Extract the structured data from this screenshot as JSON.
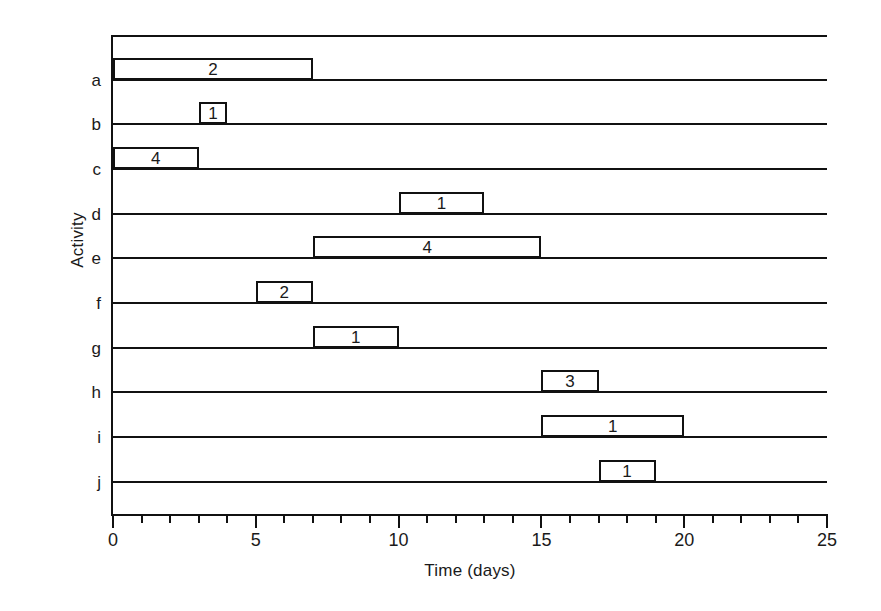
{
  "chart_data": {
    "type": "bar",
    "chart_subtype": "gantt",
    "title": "",
    "xlabel": "Time (days)",
    "ylabel": "Activity",
    "xlim": [
      0,
      25
    ],
    "xticks": [
      0,
      1,
      2,
      3,
      4,
      5,
      6,
      7,
      8,
      9,
      10,
      11,
      12,
      13,
      14,
      15,
      16,
      17,
      18,
      19,
      20,
      21,
      22,
      23,
      24,
      25
    ],
    "xtick_labels": [
      "0",
      "5",
      "10",
      "15",
      "20",
      "25"
    ],
    "xtick_label_values": [
      0,
      5,
      10,
      15,
      20,
      25
    ],
    "xtick_minor_step": 1,
    "categories": [
      "a",
      "b",
      "c",
      "d",
      "e",
      "f",
      "g",
      "h",
      "i",
      "j"
    ],
    "grid": true,
    "grid_axis": "y",
    "legend": false,
    "bar_fill": "none",
    "bar_edge_color": "#111111",
    "background": "#ffffff",
    "tasks": [
      {
        "activity": "a",
        "start": 0,
        "end": 7,
        "duration": 7,
        "label": "2"
      },
      {
        "activity": "b",
        "start": 3,
        "end": 4,
        "duration": 1,
        "label": "1"
      },
      {
        "activity": "c",
        "start": 0,
        "end": 3,
        "duration": 3,
        "label": "4"
      },
      {
        "activity": "d",
        "start": 10,
        "end": 13,
        "duration": 3,
        "label": "1"
      },
      {
        "activity": "e",
        "start": 7,
        "end": 15,
        "duration": 8,
        "label": "4"
      },
      {
        "activity": "f",
        "start": 5,
        "end": 7,
        "duration": 2,
        "label": "2"
      },
      {
        "activity": "g",
        "start": 7,
        "end": 10,
        "duration": 3,
        "label": "1"
      },
      {
        "activity": "h",
        "start": 15,
        "end": 17,
        "duration": 2,
        "label": "3"
      },
      {
        "activity": "i",
        "start": 15,
        "end": 20,
        "duration": 5,
        "label": "1"
      },
      {
        "activity": "j",
        "start": 17,
        "end": 19,
        "duration": 2,
        "label": "1"
      }
    ]
  }
}
